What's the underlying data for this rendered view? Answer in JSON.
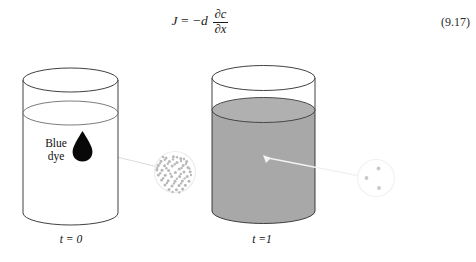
{
  "equation": {
    "lhs": "J",
    "equals": "=",
    "rhs_coefficient": "−d",
    "fraction_numerator": "∂c",
    "fraction_denominator": "∂x",
    "plain_text": "J = −d ∂c/∂x",
    "number": "(9.17)"
  },
  "figure": {
    "type": "diffusion-of-dye-in-beaker",
    "dye_label_line1": "Blue",
    "dye_label_line2": "dye",
    "left_time_label": "t = 0",
    "right_time_label": "t =1",
    "colors": {
      "outline": "#2b2b2b",
      "dye_drop": "#080808",
      "dispersed_fill": "#a8a8a8",
      "dispersed_fill_top": "#b0b0b0",
      "pointer_line": "#dcdcdc",
      "pointer_line_light": "#f2f2f2",
      "magnifier_outline": "#ececec",
      "particle": "#b9b9b9",
      "background": "#ffffff"
    },
    "left_beaker": {
      "state": "undiffused",
      "fill": "empty-white",
      "water_level": "high",
      "dye": "single concentrated drop"
    },
    "right_beaker": {
      "state": "fully-diffused",
      "fill": "uniform-gray",
      "water_level": "high",
      "dye": "evenly dispersed"
    },
    "left_magnifier": {
      "label": "concentrated-particles",
      "particle_count": 62
    },
    "right_magnifier": {
      "label": "dilute-particles",
      "particle_count": 3
    }
  }
}
